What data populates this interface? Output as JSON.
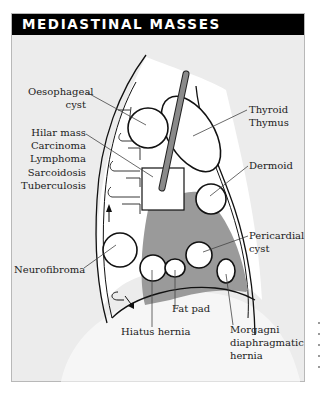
{
  "header": {
    "title": "MEDIASTINAL MASSES",
    "background": "#000000",
    "text_color": "#ffffff"
  },
  "colors": {
    "panel_background": "#ececec",
    "shaded_region": "#9a9a9a",
    "tube": "#7a7a7a",
    "outline": "#111111",
    "leader_line": "#444444"
  },
  "labels": {
    "oesophageal_cyst": {
      "lines": [
        "Oesophageal",
        "cyst"
      ]
    },
    "hilar_mass": {
      "lines": [
        "Hilar mass",
        "Carcinoma",
        "Lymphoma",
        "Sarcoidosis",
        "Tuberculosis"
      ]
    },
    "neurofibroma": {
      "lines": [
        "Neurofibroma"
      ]
    },
    "thyroid_thymus": {
      "lines": [
        "Thyroid",
        "Thymus"
      ]
    },
    "dermoid": {
      "lines": [
        "Dermoid"
      ]
    },
    "pericardial_cyst": {
      "lines": [
        "Pericardial",
        "cyst"
      ]
    },
    "fat_pad": {
      "lines": [
        "Fat pad"
      ]
    },
    "hiatus_hernia": {
      "lines": [
        "Hiatus hernia"
      ]
    },
    "morgagni_hernia": {
      "lines": [
        "Morgagni",
        "diaphragmatic",
        "hernia"
      ]
    }
  }
}
